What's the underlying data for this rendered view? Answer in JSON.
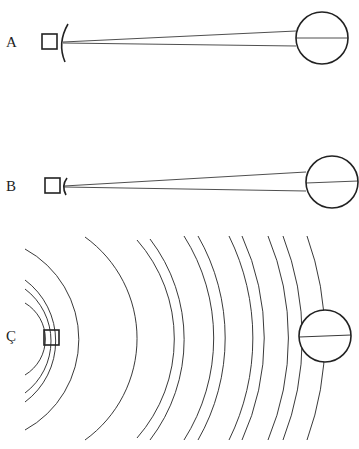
{
  "panels": [
    {
      "label": "A",
      "description": "Source with large curved reflector; narrow beam to sphere",
      "source_shape": "square",
      "reflector": "large-arc",
      "target_shape": "circle-with-diameter"
    },
    {
      "label": "B",
      "description": "Source with small curved reflector; narrow beam to sphere",
      "source_shape": "square",
      "reflector": "small-arc",
      "target_shape": "circle-with-diameter"
    },
    {
      "label": "Ç",
      "description": "Source emitting concentric wavefronts reaching sphere",
      "source_shape": "square",
      "wavefronts": 12,
      "target_shape": "circle-with-diameter"
    }
  ],
  "colors": {
    "stroke": "#222222",
    "background": "#ffffff"
  }
}
